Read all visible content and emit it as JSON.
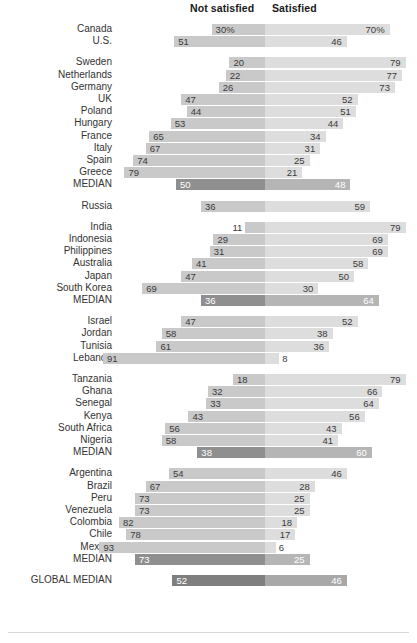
{
  "header": {
    "left_label": "Not satisfied",
    "right_label": "Satisfied"
  },
  "colors": {
    "bar_left": "#c9c9c9",
    "bar_right": "#dddddd",
    "median_left": "#8f8f8f",
    "median_right": "#b5b5b5",
    "global_left": "#7f7f7f",
    "global_right": "#a8a8a8",
    "text": "#333333",
    "median_text": "#ffffff"
  },
  "chart_data": {
    "type": "bar",
    "title": "",
    "subtitle": "",
    "xlabel": "",
    "ylabel": "",
    "orientation": "horizontal-diverging",
    "legend_position": "top",
    "grid": false,
    "axis_center_value": 0,
    "series": [
      {
        "name": "Not satisfied",
        "side": "left"
      },
      {
        "name": "Satisfied",
        "side": "right"
      }
    ],
    "unit_suffix_first_row": "%",
    "groups": [
      {
        "name": "North America",
        "rows": [
          {
            "label": "Canada",
            "not_satisfied": 30,
            "satisfied": 70,
            "left_display": "30%",
            "right_display": "70%",
            "kind": "country"
          },
          {
            "label": "U.S.",
            "not_satisfied": 51,
            "satisfied": 46,
            "left_display": "51",
            "right_display": "46",
            "kind": "country"
          }
        ]
      },
      {
        "name": "Europe",
        "rows": [
          {
            "label": "Sweden",
            "not_satisfied": 20,
            "satisfied": 79,
            "left_display": "20",
            "right_display": "79",
            "kind": "country"
          },
          {
            "label": "Netherlands",
            "not_satisfied": 22,
            "satisfied": 77,
            "left_display": "22",
            "right_display": "77",
            "kind": "country"
          },
          {
            "label": "Germany",
            "not_satisfied": 26,
            "satisfied": 73,
            "left_display": "26",
            "right_display": "73",
            "kind": "country"
          },
          {
            "label": "UK",
            "not_satisfied": 47,
            "satisfied": 52,
            "left_display": "47",
            "right_display": "52",
            "kind": "country"
          },
          {
            "label": "Poland",
            "not_satisfied": 44,
            "satisfied": 51,
            "left_display": "44",
            "right_display": "51",
            "kind": "country"
          },
          {
            "label": "Hungary",
            "not_satisfied": 53,
            "satisfied": 44,
            "left_display": "53",
            "right_display": "44",
            "kind": "country"
          },
          {
            "label": "France",
            "not_satisfied": 65,
            "satisfied": 34,
            "left_display": "65",
            "right_display": "34",
            "kind": "country"
          },
          {
            "label": "Italy",
            "not_satisfied": 67,
            "satisfied": 31,
            "left_display": "67",
            "right_display": "31",
            "kind": "country"
          },
          {
            "label": "Spain",
            "not_satisfied": 74,
            "satisfied": 25,
            "left_display": "74",
            "right_display": "25",
            "kind": "country"
          },
          {
            "label": "Greece",
            "not_satisfied": 79,
            "satisfied": 21,
            "left_display": "79",
            "right_display": "21",
            "kind": "country"
          },
          {
            "label": "MEDIAN",
            "not_satisfied": 50,
            "satisfied": 48,
            "left_display": "50",
            "right_display": "48",
            "kind": "median"
          }
        ]
      },
      {
        "name": "Russia",
        "rows": [
          {
            "label": "Russia",
            "not_satisfied": 36,
            "satisfied": 59,
            "left_display": "36",
            "right_display": "59",
            "kind": "country"
          }
        ]
      },
      {
        "name": "Asia",
        "rows": [
          {
            "label": "India",
            "not_satisfied": 11,
            "satisfied": 79,
            "left_display": "11",
            "right_display": "79",
            "kind": "country",
            "left_outside": true
          },
          {
            "label": "Indonesia",
            "not_satisfied": 29,
            "satisfied": 69,
            "left_display": "29",
            "right_display": "69",
            "kind": "country"
          },
          {
            "label": "Philippines",
            "not_satisfied": 31,
            "satisfied": 69,
            "left_display": "31",
            "right_display": "69",
            "kind": "country"
          },
          {
            "label": "Australia",
            "not_satisfied": 41,
            "satisfied": 58,
            "left_display": "41",
            "right_display": "58",
            "kind": "country"
          },
          {
            "label": "Japan",
            "not_satisfied": 47,
            "satisfied": 50,
            "left_display": "47",
            "right_display": "50",
            "kind": "country"
          },
          {
            "label": "South Korea",
            "not_satisfied": 69,
            "satisfied": 30,
            "left_display": "69",
            "right_display": "30",
            "kind": "country"
          },
          {
            "label": "MEDIAN",
            "not_satisfied": 36,
            "satisfied": 64,
            "left_display": "36",
            "right_display": "64",
            "kind": "median"
          }
        ]
      },
      {
        "name": "Middle East",
        "rows": [
          {
            "label": "Israel",
            "not_satisfied": 47,
            "satisfied": 52,
            "left_display": "47",
            "right_display": "52",
            "kind": "country"
          },
          {
            "label": "Jordan",
            "not_satisfied": 58,
            "satisfied": 38,
            "left_display": "58",
            "right_display": "38",
            "kind": "country"
          },
          {
            "label": "Tunisia",
            "not_satisfied": 61,
            "satisfied": 36,
            "left_display": "61",
            "right_display": "36",
            "kind": "country"
          },
          {
            "label": "Lebanon",
            "not_satisfied": 91,
            "satisfied": 8,
            "left_display": "91",
            "right_display": "8",
            "kind": "country",
            "right_outside": true
          }
        ]
      },
      {
        "name": "Africa",
        "rows": [
          {
            "label": "Tanzania",
            "not_satisfied": 18,
            "satisfied": 79,
            "left_display": "18",
            "right_display": "79",
            "kind": "country"
          },
          {
            "label": "Ghana",
            "not_satisfied": 32,
            "satisfied": 66,
            "left_display": "32",
            "right_display": "66",
            "kind": "country"
          },
          {
            "label": "Senegal",
            "not_satisfied": 33,
            "satisfied": 64,
            "left_display": "33",
            "right_display": "64",
            "kind": "country"
          },
          {
            "label": "Kenya",
            "not_satisfied": 43,
            "satisfied": 56,
            "left_display": "43",
            "right_display": "56",
            "kind": "country"
          },
          {
            "label": "South Africa",
            "not_satisfied": 56,
            "satisfied": 43,
            "left_display": "56",
            "right_display": "43",
            "kind": "country"
          },
          {
            "label": "Nigeria",
            "not_satisfied": 58,
            "satisfied": 41,
            "left_display": "58",
            "right_display": "41",
            "kind": "country"
          },
          {
            "label": "MEDIAN",
            "not_satisfied": 38,
            "satisfied": 60,
            "left_display": "38",
            "right_display": "60",
            "kind": "median"
          }
        ]
      },
      {
        "name": "Latin America",
        "rows": [
          {
            "label": "Argentina",
            "not_satisfied": 54,
            "satisfied": 46,
            "left_display": "54",
            "right_display": "46",
            "kind": "country"
          },
          {
            "label": "Brazil",
            "not_satisfied": 67,
            "satisfied": 28,
            "left_display": "67",
            "right_display": "28",
            "kind": "country"
          },
          {
            "label": "Peru",
            "not_satisfied": 73,
            "satisfied": 25,
            "left_display": "73",
            "right_display": "25",
            "kind": "country"
          },
          {
            "label": "Venezuela",
            "not_satisfied": 73,
            "satisfied": 25,
            "left_display": "73",
            "right_display": "25",
            "kind": "country"
          },
          {
            "label": "Colombia",
            "not_satisfied": 82,
            "satisfied": 18,
            "left_display": "82",
            "right_display": "18",
            "kind": "country"
          },
          {
            "label": "Chile",
            "not_satisfied": 78,
            "satisfied": 17,
            "left_display": "78",
            "right_display": "17",
            "kind": "country"
          },
          {
            "label": "Mexico",
            "not_satisfied": 93,
            "satisfied": 6,
            "left_display": "93",
            "right_display": "6",
            "kind": "country",
            "right_outside": true
          },
          {
            "label": "MEDIAN",
            "not_satisfied": 73,
            "satisfied": 25,
            "left_display": "73",
            "right_display": "25",
            "kind": "median"
          }
        ]
      },
      {
        "name": "Global",
        "rows": [
          {
            "label": "GLOBAL MEDIAN",
            "not_satisfied": 52,
            "satisfied": 46,
            "left_display": "52",
            "right_display": "46",
            "kind": "global"
          }
        ]
      }
    ]
  }
}
